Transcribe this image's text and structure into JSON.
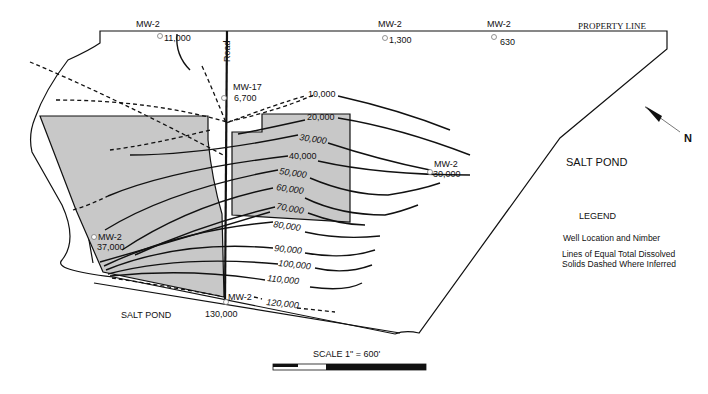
{
  "map": {
    "property_line_label": "PROPERTY LINE",
    "road_label": "Road",
    "salt_pond_east": "SALT POND",
    "salt_pond_south": "SALT POND",
    "north_label": "N",
    "scale_label": "SCALE  1\" = 600'",
    "colors": {
      "shaded_area": "#c8c8c8",
      "line": "#111111",
      "well_symbol": "#777777"
    }
  },
  "wells": [
    {
      "id": "MW-2",
      "value": "11,000"
    },
    {
      "id": "MW-2",
      "value": "1,300"
    },
    {
      "id": "MW-2",
      "value": "630"
    },
    {
      "id": "MW-17",
      "value": "6,700"
    },
    {
      "id": "MW-2",
      "value": "30,000"
    },
    {
      "id": "MW-2",
      "value": "37,000"
    },
    {
      "id": "MW-2",
      "value": "130,000"
    }
  ],
  "isolines": [
    {
      "value": "10,000",
      "inferred": "partial"
    },
    {
      "value": "20,000",
      "inferred": "partial"
    },
    {
      "value": "30,000",
      "inferred": false
    },
    {
      "value": "40,000",
      "inferred": false
    },
    {
      "value": "50,000",
      "inferred": false
    },
    {
      "value": "60,000",
      "inferred": false
    },
    {
      "value": "70,000",
      "inferred": false
    },
    {
      "value": "80,000",
      "inferred": false
    },
    {
      "value": "90,000",
      "inferred": false
    },
    {
      "value": "100,000",
      "inferred": false
    },
    {
      "value": "110,000",
      "inferred": false
    },
    {
      "value": "120,000",
      "inferred": "partial"
    }
  ],
  "legend": {
    "title": "LEGEND",
    "items": [
      {
        "label": "Well Location and Nimber"
      },
      {
        "label": "Lines of Equal Total Dissolved"
      },
      {
        "label": "Solids Dashed Where Inferred"
      }
    ]
  }
}
